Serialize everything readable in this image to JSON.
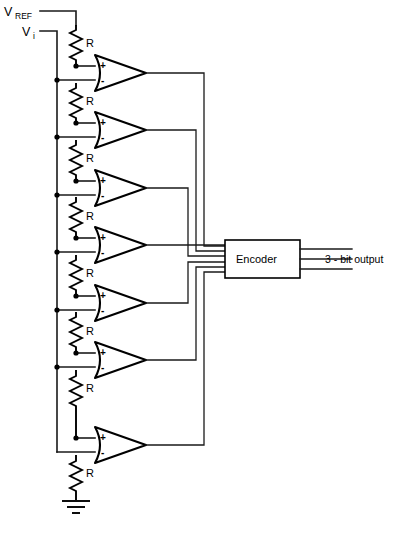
{
  "diagram": {
    "terminals": {
      "vref_label": "V",
      "vref_sub": "REF",
      "vi_label": "V",
      "vi_sub": "i"
    },
    "resistor_label": "R",
    "resistor_count": 8,
    "comparator_count": 7,
    "comparator_plus": "+",
    "comparator_minus": "-",
    "encoder": {
      "label": "Encoder",
      "output_label": "3 - bit output",
      "input_line_count": 7,
      "output_line_count": 3
    },
    "ground": {
      "name": "ground-symbol"
    },
    "colors": {
      "line": "#1a1a1a",
      "fill": "#ffffff",
      "text": "#000000"
    }
  },
  "geometry": {
    "ladder_x": 76,
    "vi_bus_x": 57,
    "comparator_ys": [
      71,
      128,
      186,
      243,
      301,
      358,
      443
    ],
    "comparator_left_x": 95,
    "comparator_tip_x": 146,
    "resistor_ys": [
      25,
      83,
      140,
      197,
      255,
      312,
      370,
      455
    ],
    "encoder_box": {
      "x": 225,
      "y": 240,
      "w": 75,
      "h": 38
    }
  }
}
